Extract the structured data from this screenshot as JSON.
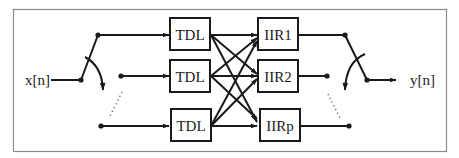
{
  "diagram": {
    "type": "block-diagram",
    "input_label": "x[n]",
    "output_label": "y[n]",
    "tdl_blocks": [
      {
        "id": "tdl1",
        "label": "TDL"
      },
      {
        "id": "tdl2",
        "label": "TDL"
      },
      {
        "id": "tdl3",
        "label": "TDL"
      }
    ],
    "iir_blocks": [
      {
        "id": "iir1",
        "label": "IIR1"
      },
      {
        "id": "iir2",
        "label": "IIR2"
      },
      {
        "id": "iirp",
        "label": "IIRp"
      }
    ],
    "connections": [
      {
        "from": "input-switch",
        "to": "tdl1"
      },
      {
        "from": "input-switch",
        "to": "tdl2"
      },
      {
        "from": "input-switch",
        "to": "tdl3"
      },
      {
        "from": "tdl1",
        "to": "iir1"
      },
      {
        "from": "tdl1",
        "to": "iir2"
      },
      {
        "from": "tdl1",
        "to": "iirp"
      },
      {
        "from": "tdl2",
        "to": "iir1"
      },
      {
        "from": "tdl2",
        "to": "iir2"
      },
      {
        "from": "tdl2",
        "to": "iirp"
      },
      {
        "from": "tdl3",
        "to": "iir1"
      },
      {
        "from": "tdl3",
        "to": "iir2"
      },
      {
        "from": "tdl3",
        "to": "iirp"
      },
      {
        "from": "iir1",
        "to": "output-switch"
      },
      {
        "from": "iir2",
        "to": "output-switch"
      },
      {
        "from": "iirp",
        "to": "output-switch"
      }
    ],
    "colors": {
      "stroke": "#1a1a1a",
      "frame": "#8a8a8a",
      "background": "#ffffff"
    }
  }
}
